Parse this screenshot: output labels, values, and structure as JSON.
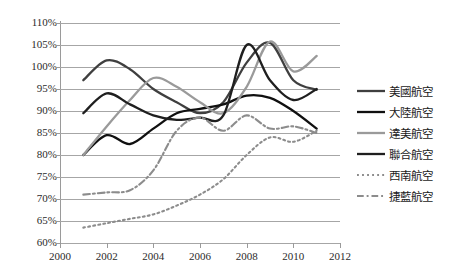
{
  "chart_data": {
    "type": "line",
    "title": "",
    "xlabel": "",
    "ylabel": "",
    "xlim": [
      2000,
      2012
    ],
    "ylim": [
      60,
      110
    ],
    "grid": true,
    "legend_position": "right",
    "x_ticks": [
      "2000",
      "2002",
      "2004",
      "2006",
      "2008",
      "2010",
      "2012"
    ],
    "x_tick_values": [
      2000,
      2002,
      2004,
      2006,
      2008,
      2010,
      2012
    ],
    "y_ticks": [
      "60%",
      "65%",
      "70%",
      "75%",
      "80%",
      "85%",
      "90%",
      "95%",
      "100%",
      "105%",
      "110%"
    ],
    "y_tick_values": [
      60,
      65,
      70,
      75,
      80,
      85,
      90,
      95,
      100,
      105,
      110
    ],
    "x": [
      2001,
      2002,
      2003,
      2004,
      2005,
      2006,
      2007,
      2008,
      2009,
      2010,
      2011
    ],
    "series": [
      {
        "name": "美國航空",
        "color": "#3f3f3f",
        "style": "solid",
        "width": 2.3,
        "values": [
          97.0,
          101.5,
          99.5,
          95.0,
          92.0,
          89.5,
          92.0,
          101.0,
          105.5,
          97.0,
          94.8
        ]
      },
      {
        "name": "大陸航空",
        "color": "#101010",
        "style": "solid",
        "width": 2.3,
        "values": [
          80.0,
          84.5,
          82.5,
          86.0,
          89.5,
          90.5,
          91.5,
          93.5,
          93.0,
          90.0,
          86.0
        ]
      },
      {
        "name": "達美航空",
        "color": "#9a9a9a",
        "style": "solid",
        "width": 2.3,
        "values": [
          80.0,
          86.5,
          92.5,
          97.5,
          95.5,
          92.0,
          89.5,
          95.5,
          105.8,
          99.0,
          102.5
        ]
      },
      {
        "name": "聯合航空",
        "color": "#1f1f1f",
        "style": "solid",
        "width": 2.3,
        "values": [
          89.5,
          94.0,
          91.5,
          89.0,
          88.0,
          88.5,
          89.0,
          105.0,
          97.0,
          92.5,
          95.0
        ]
      },
      {
        "name": "西南航空",
        "color": "#8c8c8c",
        "style": "dotted",
        "width": 2.1,
        "values": [
          63.5,
          64.5,
          65.5,
          66.5,
          68.5,
          71.0,
          74.5,
          80.0,
          84.0,
          83.0,
          85.5
        ]
      },
      {
        "name": "捷藍航空",
        "color": "#8c8c8c",
        "style": "dashdot",
        "width": 2.1,
        "values": [
          71.0,
          71.5,
          72.0,
          76.5,
          85.5,
          88.5,
          85.5,
          89.0,
          86.0,
          86.5,
          85.0
        ]
      }
    ]
  },
  "legend": {
    "items": [
      {
        "label": "美國航空"
      },
      {
        "label": "大陸航空"
      },
      {
        "label": "達美航空"
      },
      {
        "label": "聯合航空"
      },
      {
        "label": "西南航空"
      },
      {
        "label": "捷藍航空"
      }
    ]
  }
}
